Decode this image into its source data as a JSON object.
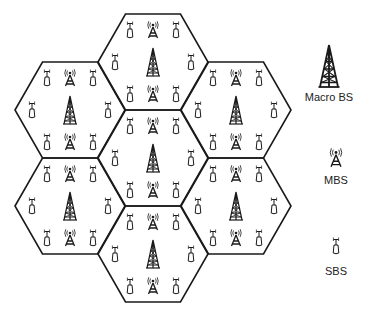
{
  "diagram": {
    "type": "hexagonal-cellular-network",
    "line_color": "#1a1a1a",
    "icon_color": "#1a1a1a",
    "background": "#ffffff",
    "hex": {
      "half_width": 55,
      "half_height": 48
    },
    "cells": [
      {
        "id": "top",
        "cx": 153,
        "cy": 62
      },
      {
        "id": "top-left",
        "cx": 70,
        "cy": 110
      },
      {
        "id": "top-right",
        "cx": 236,
        "cy": 110
      },
      {
        "id": "center",
        "cx": 153,
        "cy": 158
      },
      {
        "id": "bottom-left",
        "cx": 70,
        "cy": 206
      },
      {
        "id": "bottom-right",
        "cx": 236,
        "cy": 206
      },
      {
        "id": "bottom",
        "cx": 153,
        "cy": 254
      }
    ],
    "cell_layout": [
      {
        "kind": "sbs",
        "dx": -23,
        "dy": -32
      },
      {
        "kind": "mbs",
        "dx": 0,
        "dy": -32
      },
      {
        "kind": "sbs",
        "dx": 23,
        "dy": -32
      },
      {
        "kind": "sbs",
        "dx": -38,
        "dy": 0
      },
      {
        "kind": "macro",
        "dx": 0,
        "dy": 0
      },
      {
        "kind": "sbs",
        "dx": 38,
        "dy": 0
      },
      {
        "kind": "sbs",
        "dx": -23,
        "dy": 32
      },
      {
        "kind": "mbs",
        "dx": 0,
        "dy": 32
      },
      {
        "kind": "sbs",
        "dx": 23,
        "dy": 32
      }
    ]
  },
  "legend": {
    "items": [
      {
        "kind": "macro",
        "label": "Macro BS",
        "icon_x": 329,
        "icon_y": 66,
        "scale": 1.5,
        "label_y": 91
      },
      {
        "kind": "mbs",
        "label": "MBS",
        "icon_x": 336,
        "icon_y": 158,
        "scale": 1.1,
        "label_y": 174
      },
      {
        "kind": "sbs",
        "label": "SBS",
        "icon_x": 336,
        "icon_y": 246,
        "scale": 1.0,
        "label_y": 265
      }
    ]
  }
}
